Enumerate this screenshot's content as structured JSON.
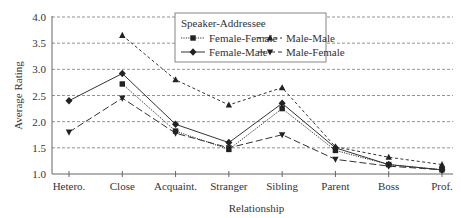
{
  "chart_data": {
    "type": "line",
    "title": "",
    "xlabel": "Relationship",
    "ylabel": "Average Rating",
    "ylim": [
      1.0,
      4.0
    ],
    "yticks": [
      "1.0",
      "1.5",
      "2.0",
      "2.5",
      "3.0",
      "3.5",
      "4.0"
    ],
    "grid": "horizontal dashed",
    "legend_title": "Speaker-Addressee",
    "legend_position": "top-center, inside",
    "categories": [
      "Hetero.",
      "Close",
      "Acquaint.",
      "Stranger",
      "Sibling",
      "Parent",
      "Boss",
      "Prof."
    ],
    "series": [
      {
        "name": "Female-Female",
        "marker": "square",
        "line": "dotted",
        "values": [
          null,
          2.72,
          1.82,
          1.47,
          2.25,
          1.45,
          1.18,
          1.08
        ]
      },
      {
        "name": "Male-Male",
        "marker": "triangle-up",
        "line": "short-dash",
        "values": [
          null,
          3.65,
          2.8,
          2.32,
          2.65,
          1.52,
          1.32,
          1.18
        ]
      },
      {
        "name": "Female-Male",
        "marker": "diamond",
        "line": "solid",
        "values": [
          2.4,
          2.92,
          1.95,
          1.6,
          2.35,
          1.5,
          1.18,
          1.08
        ]
      },
      {
        "name": "Male-Female",
        "marker": "triangle-down",
        "line": "long-dash",
        "values": [
          1.8,
          2.45,
          1.78,
          1.5,
          1.75,
          1.28,
          1.15,
          1.08
        ]
      }
    ]
  }
}
